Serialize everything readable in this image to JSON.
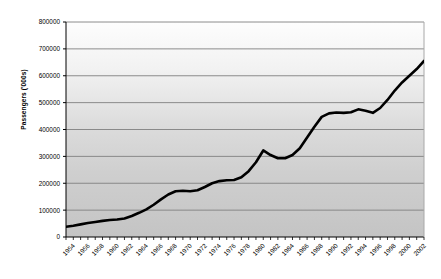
{
  "chart_data": {
    "type": "line",
    "title": "",
    "xlabel": "",
    "ylabel": "Passengers ('000s)",
    "ylim": [
      0,
      800000
    ],
    "ytick_values": [
      0,
      100000,
      200000,
      300000,
      400000,
      500000,
      600000,
      700000,
      800000
    ],
    "ytick_labels": [
      "0",
      "100000",
      "200000",
      "300000",
      "400000",
      "500000",
      "600000",
      "700000",
      "800000"
    ],
    "xlim": [
      1954,
      2003
    ],
    "xtick_labels": [
      "1954",
      "1956",
      "1958",
      "1960",
      "1962",
      "1964",
      "1966",
      "1968",
      "1970",
      "1972",
      "1974",
      "1976",
      "1978",
      "1980",
      "1982",
      "1984",
      "1986",
      "1988",
      "1990",
      "1992",
      "1994",
      "1996",
      "1998",
      "2000",
      "2002"
    ],
    "grid": "horizontal",
    "legend": "none",
    "line_color": "#000000",
    "line_width": 2.6,
    "plot_bg_top": "#fbfbfb",
    "plot_bg_bottom": "#c6c6c6",
    "grid_color": "#808080",
    "axis_color": "#000000",
    "x": [
      1954,
      1955,
      1956,
      1957,
      1958,
      1959,
      1960,
      1961,
      1962,
      1963,
      1964,
      1965,
      1966,
      1967,
      1968,
      1969,
      1970,
      1971,
      1972,
      1973,
      1974,
      1975,
      1976,
      1977,
      1978,
      1979,
      1980,
      1981,
      1982,
      1983,
      1984,
      1985,
      1986,
      1987,
      1988,
      1989,
      1990,
      1991,
      1992,
      1993,
      1994,
      1995,
      1996,
      1997,
      1998,
      1999,
      2000,
      2001,
      2002,
      2003
    ],
    "values": [
      38000,
      42000,
      47000,
      52000,
      56000,
      60000,
      63000,
      65000,
      69000,
      78000,
      90000,
      103000,
      120000,
      140000,
      158000,
      170000,
      172000,
      170000,
      174000,
      186000,
      200000,
      208000,
      211000,
      212000,
      222000,
      245000,
      278000,
      322000,
      305000,
      293000,
      293000,
      305000,
      330000,
      370000,
      410000,
      447000,
      460000,
      463000,
      462000,
      464000,
      475000,
      470000,
      462000,
      480000,
      510000,
      545000,
      575000,
      600000,
      625000,
      655000
    ],
    "annotations": []
  },
  "axis": {
    "y_title": "Passengers ('000s)"
  }
}
